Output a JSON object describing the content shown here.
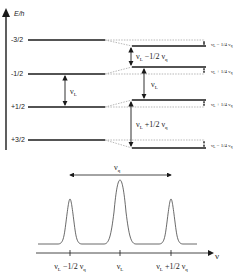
{
  "energy_diagram": {
    "axis_label": "E/h",
    "levels": [
      {
        "m": "-3/2"
      },
      {
        "m": "-1/2"
      },
      {
        "m": "+1/2"
      },
      {
        "m": "+3/2"
      }
    ],
    "left_transition": {
      "nu": "ν",
      "sub": "L"
    },
    "right_transitions": [
      {
        "nu": "ν",
        "sub": "L",
        "rest": " −1/2 ν",
        "sub2": "q"
      },
      {
        "nu": "ν",
        "sub": "L",
        "rest": "",
        "sub2": ""
      },
      {
        "nu": "ν",
        "sub": "L",
        "rest": " +1/2 ν",
        "sub2": "q"
      }
    ],
    "shifts": [
      {
        "a": "ν",
        "sub": "L",
        "rest": " − 1/4 ν",
        "sub2": "q"
      },
      {
        "a": "ν",
        "sub": "L",
        "rest": " + 1/4 ν",
        "sub2": "q"
      },
      {
        "a": "ν",
        "sub": "L",
        "rest": " + 1/4 ν",
        "sub2": "q"
      },
      {
        "a": "ν",
        "sub": "L",
        "rest": " − 1/4 ν",
        "sub2": "q"
      }
    ]
  },
  "spectrum": {
    "splitting_label": {
      "nu": "ν",
      "sub": "q"
    },
    "axis_label": "ν",
    "ticks": [
      {
        "nu": "ν",
        "sub": "L",
        "rest": " −1/2 ν",
        "sub2": "q"
      },
      {
        "nu": "ν",
        "sub": "L",
        "rest": "",
        "sub2": ""
      },
      {
        "nu": "ν",
        "sub": "L",
        "rest": " +1/2 ν",
        "sub2": "q"
      }
    ]
  },
  "colors": {
    "line": "#1a1a1a",
    "dashed": "#888888"
  }
}
